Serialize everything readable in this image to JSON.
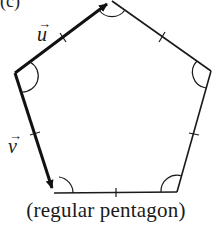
{
  "figure": {
    "part_label": "(c)",
    "caption": "(regular pentagon)",
    "shape": "regular pentagon",
    "stroke_color": "#1a1a1a",
    "vertices": [
      {
        "name": "top",
        "x": 112,
        "y": 1
      },
      {
        "name": "right",
        "x": 211,
        "y": 71
      },
      {
        "name": "bottom-right",
        "x": 177,
        "y": 192
      },
      {
        "name": "bottom-left",
        "x": 54,
        "y": 193
      },
      {
        "name": "left",
        "x": 15,
        "y": 73
      }
    ],
    "vectors": [
      {
        "name": "u",
        "label": "u",
        "arrow": "→",
        "from": "left",
        "to": "top"
      },
      {
        "name": "v",
        "label": "v",
        "arrow": "→",
        "from": "left",
        "to": "bottom-left"
      }
    ],
    "markings": {
      "equal_side_ticks": 5,
      "equal_angle_arcs": 5
    }
  }
}
